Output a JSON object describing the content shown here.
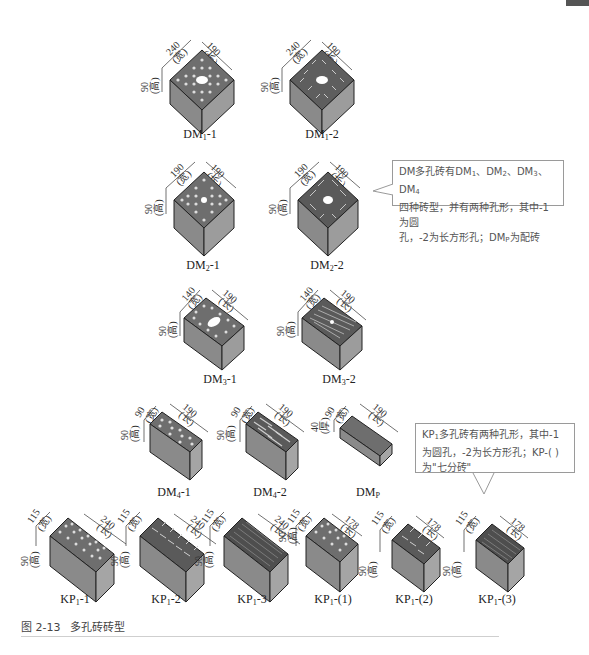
{
  "figure": {
    "caption_number": "图 2-13",
    "caption_title": "多孔砖砖型"
  },
  "labels": {
    "height": "高",
    "width": "宽",
    "length": "长",
    "thickness": "厚"
  },
  "bricks": [
    {
      "id": "DM1-1",
      "base": "DM",
      "sub": "1",
      "suffix": "-1",
      "dims": {
        "w": "240",
        "l": "190",
        "h": "90"
      },
      "holes": "round-center"
    },
    {
      "id": "DM1-2",
      "base": "DM",
      "sub": "1",
      "suffix": "-2",
      "dims": {
        "w": "240",
        "l": "190",
        "h": "90"
      },
      "holes": "slot-center"
    },
    {
      "id": "DM2-1",
      "base": "DM",
      "sub": "2",
      "suffix": "-1",
      "dims": {
        "w": "190",
        "l": "190",
        "h": "90"
      },
      "holes": "round-center"
    },
    {
      "id": "DM2-2",
      "base": "DM",
      "sub": "2",
      "suffix": "-2",
      "dims": {
        "w": "190",
        "l": "190",
        "h": "90"
      },
      "holes": "slot-center"
    },
    {
      "id": "DM3-1",
      "base": "DM",
      "sub": "3",
      "suffix": "-1",
      "dims": {
        "w": "140",
        "l": "190",
        "h": "90"
      },
      "holes": "round-center"
    },
    {
      "id": "DM3-2",
      "base": "DM",
      "sub": "3",
      "suffix": "-2",
      "dims": {
        "w": "140",
        "l": "190",
        "h": "90"
      },
      "holes": "slot-center"
    },
    {
      "id": "DM4-1",
      "base": "DM",
      "sub": "4",
      "suffix": "-1",
      "dims": {
        "w": "90",
        "l": "190",
        "h": "90"
      },
      "holes": "round"
    },
    {
      "id": "DM4-2",
      "base": "DM",
      "sub": "4",
      "suffix": "-2",
      "dims": {
        "w": "90",
        "l": "190",
        "h": "90"
      },
      "holes": "slot"
    },
    {
      "id": "DMP",
      "base": "DM",
      "sub": "P",
      "suffix": "",
      "dims": {
        "w": "90",
        "l": "190",
        "h": "40",
        "h_label": "厚"
      },
      "holes": "none"
    },
    {
      "id": "KP1-1",
      "base": "KP",
      "sub": "1",
      "suffix": "-1",
      "dims": {
        "w": "115",
        "l": "240",
        "h": "90"
      },
      "holes": "round"
    },
    {
      "id": "KP1-2",
      "base": "KP",
      "sub": "1",
      "suffix": "-2",
      "dims": {
        "w": "115",
        "l": "240",
        "h": "90"
      },
      "holes": "slot"
    },
    {
      "id": "KP1-3",
      "base": "KP",
      "sub": "1",
      "suffix": "-3",
      "dims": {
        "w": "115",
        "l": "240",
        "h": "90"
      },
      "holes": "fine"
    },
    {
      "id": "KP1-(1)",
      "base": "KP",
      "sub": "1",
      "suffix": "-(1)",
      "dims": {
        "w": "115",
        "l": "178",
        "h": "90"
      },
      "holes": "round"
    },
    {
      "id": "KP1-(2)",
      "base": "KP",
      "sub": "1",
      "suffix": "-(2)",
      "dims": {
        "w": "115",
        "l": "178",
        "h": "90"
      },
      "holes": "slot"
    },
    {
      "id": "KP1-(3)",
      "base": "KP",
      "sub": "1",
      "suffix": "-(3)",
      "dims": {
        "w": "115",
        "l": "178",
        "h": "90"
      },
      "holes": "fine"
    }
  ],
  "callouts": {
    "dm": {
      "line1_a": "DM多孔砖有DM",
      "s1": "1",
      "sep1": "、DM",
      "s2": "2",
      "sep2": "、DM",
      "s3": "3",
      "sep3": "、DM",
      "s4": "4",
      "line2": "四种砖型，并有两种孔形，其中-1为圆",
      "line3_a": "孔，-2为长方形孔；DM",
      "sp": "P",
      "line3_b": "为配砖"
    },
    "kp": {
      "line1_a": "KP",
      "s1": "1",
      "line1_b": "多孔砖有两种孔形，其中-1",
      "line2": "为圆孔，-2为长方形孔；KP-(  )",
      "line3": "为\"七分砖\""
    }
  },
  "colors": {
    "face_top": "#6e6e6e",
    "face_left": "#8a8a8a",
    "face_right": "#9c9c9c",
    "outline": "#222222",
    "callout_border": "#9a9a9a",
    "callout_text": "#555555"
  }
}
